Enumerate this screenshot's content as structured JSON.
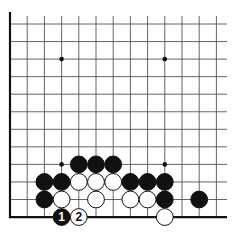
{
  "diagram": {
    "type": "go-board-fragment",
    "grid": {
      "columns": 13,
      "rows": 12,
      "origin_x": 10,
      "origin_y": 24,
      "spacing_x": 17.2,
      "spacing_y": 17.55,
      "right_edge_x": 227,
      "left_edge_thick": true,
      "bottom_edge_thick": true,
      "line_color": "#555555",
      "edge_color": "#111111"
    },
    "star_points": [
      {
        "col": 3,
        "row": 2
      },
      {
        "col": 9,
        "row": 2
      },
      {
        "col": 3,
        "row": 8
      },
      {
        "col": 9,
        "row": 8
      }
    ],
    "stones": [
      {
        "col": 4,
        "row": 8,
        "color": "black"
      },
      {
        "col": 5,
        "row": 8,
        "color": "black"
      },
      {
        "col": 6,
        "row": 8,
        "color": "black"
      },
      {
        "col": 2,
        "row": 9,
        "color": "black"
      },
      {
        "col": 3,
        "row": 9,
        "color": "black"
      },
      {
        "col": 4,
        "row": 9,
        "color": "white"
      },
      {
        "col": 5,
        "row": 9,
        "color": "white"
      },
      {
        "col": 6,
        "row": 9,
        "color": "white"
      },
      {
        "col": 7,
        "row": 9,
        "color": "black"
      },
      {
        "col": 8,
        "row": 9,
        "color": "black"
      },
      {
        "col": 9,
        "row": 9,
        "color": "black"
      },
      {
        "col": 2,
        "row": 10,
        "color": "black"
      },
      {
        "col": 3,
        "row": 10,
        "color": "white"
      },
      {
        "col": 5,
        "row": 10,
        "color": "white"
      },
      {
        "col": 7,
        "row": 10,
        "color": "white"
      },
      {
        "col": 8,
        "row": 10,
        "color": "white"
      },
      {
        "col": 9,
        "row": 10,
        "color": "black"
      },
      {
        "col": 11,
        "row": 10,
        "color": "black"
      },
      {
        "col": 3,
        "row": 11,
        "color": "black",
        "label": "1"
      },
      {
        "col": 4,
        "row": 11,
        "color": "white",
        "label": "2"
      },
      {
        "col": 9,
        "row": 11,
        "color": "white"
      }
    ],
    "colors": {
      "black_stone": "#111111",
      "white_stone": "#ffffff",
      "stone_outline": "#111111",
      "background": "#ffffff"
    }
  }
}
